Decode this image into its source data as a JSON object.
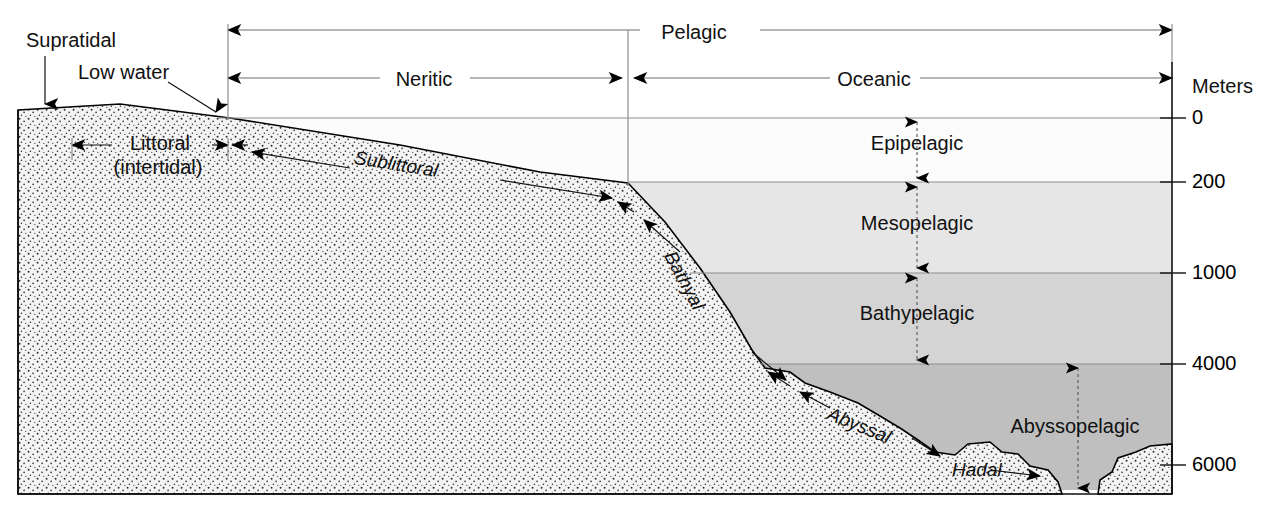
{
  "diagram": {
    "axis_title": "Meters",
    "depth_ticks": [
      {
        "label": "0",
        "value": 0
      },
      {
        "label": "200",
        "value": 200
      },
      {
        "label": "1000",
        "value": 1000
      },
      {
        "label": "4000",
        "value": 4000
      },
      {
        "label": "6000",
        "value": 6000
      }
    ],
    "horizontal_zones": [
      {
        "label": "Pelagic",
        "level": 1
      },
      {
        "label": "Neritic",
        "level": 2
      },
      {
        "label": "Oceanic",
        "level": 2
      }
    ],
    "benthic_zones": [
      {
        "label": "Supratidal",
        "style": "upright"
      },
      {
        "label": "Low water",
        "style": "upright"
      },
      {
        "label": "Littoral",
        "style": "upright"
      },
      {
        "label": "(intertidal)",
        "style": "upright"
      },
      {
        "label": "Sublittoral",
        "style": "italic"
      },
      {
        "label": "Bathyal",
        "style": "italic"
      },
      {
        "label": "Abyssal",
        "style": "italic"
      },
      {
        "label": "Hadal",
        "style": "italic"
      }
    ],
    "pelagic_zones": [
      {
        "label": "Epipelagic",
        "top_m": 0,
        "bottom_m": 200,
        "shade": "#ffffff"
      },
      {
        "label": "Mesopelagic",
        "top_m": 200,
        "bottom_m": 1000,
        "shade": "#e4e4e4"
      },
      {
        "label": "Bathypelagic",
        "top_m": 1000,
        "bottom_m": 4000,
        "shade": "#d2d2d2"
      },
      {
        "label": "Abyssopelagic",
        "top_m": 4000,
        "bottom_m": 6000,
        "shade": "#bdbdbd"
      }
    ],
    "colors": {
      "line": "#000000",
      "sediment": "#f2f2f2",
      "guide": "#9a9a9a"
    }
  }
}
